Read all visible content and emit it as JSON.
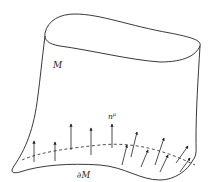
{
  "diagram": {
    "labels": {
      "manifold": "M",
      "normal": "n",
      "normal_index": "μ",
      "boundary": "∂M"
    },
    "colors": {
      "stroke": "#222222",
      "background": "#ffffff"
    },
    "arrows": {
      "count": 12,
      "style": "normal vectors on boundary"
    }
  }
}
